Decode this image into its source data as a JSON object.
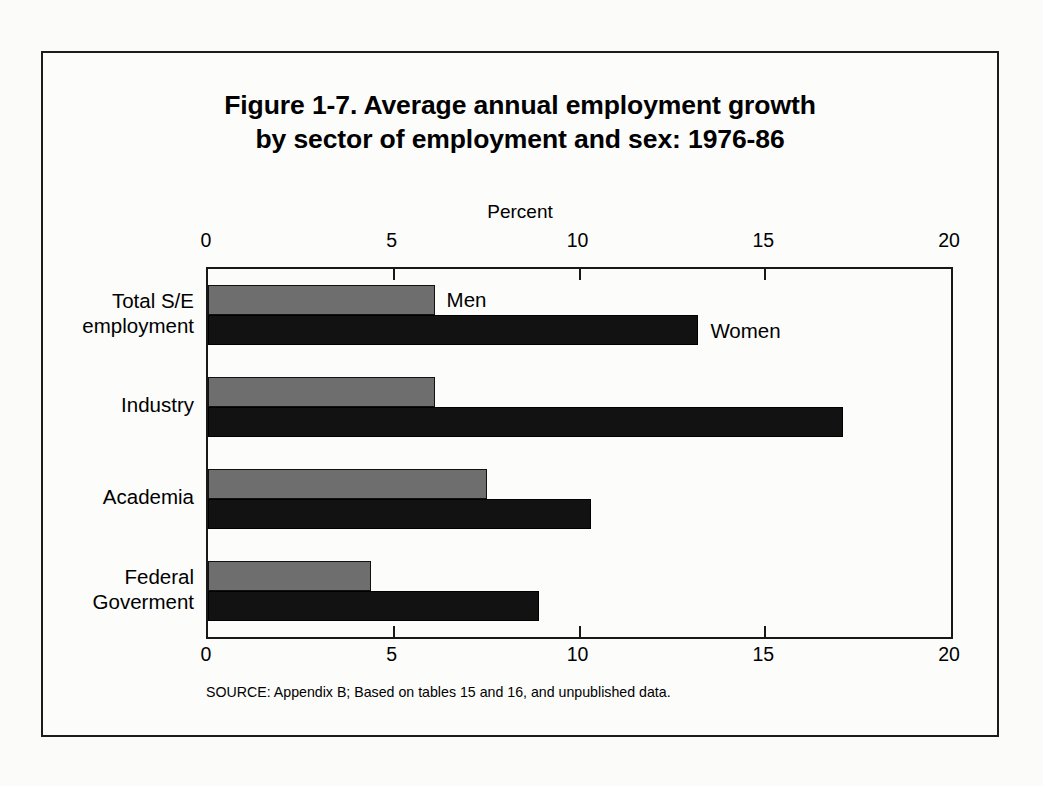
{
  "figure": {
    "title": "Figure 1-7.  Average annual employment growth\nby sector of employment and sex:  1976-86",
    "source": "SOURCE:  Appendix B; Based on tables 15 and 16, and unpublished data.",
    "annotations": {
      "men": "Men",
      "women": "Women"
    },
    "colors": {
      "men_fill": "#6e6e6e",
      "women_fill": "#121212",
      "axis": "#181818",
      "frame": "#1c1c1c",
      "page_background": "#fbfbfa"
    }
  },
  "chart_data": {
    "type": "bar",
    "orientation": "horizontal",
    "title": "Figure 1-7.  Average annual employment growth by sector of employment and sex: 1976-86",
    "xlabel": "Percent",
    "ylabel": "",
    "xlim": [
      0,
      20
    ],
    "xticks": [
      0,
      5,
      10,
      15,
      20
    ],
    "xticklabels": [
      "0",
      "5",
      "10",
      "15",
      "20"
    ],
    "grid": false,
    "legend": "inline-annotations",
    "categories": [
      "Total S/E\nemployment",
      "Industry",
      "Academia",
      "Federal\nGoverment"
    ],
    "series": [
      {
        "name": "Men",
        "values": [
          6.1,
          6.1,
          7.5,
          4.4
        ]
      },
      {
        "name": "Women",
        "values": [
          13.2,
          17.1,
          10.3,
          8.9
        ]
      }
    ]
  }
}
